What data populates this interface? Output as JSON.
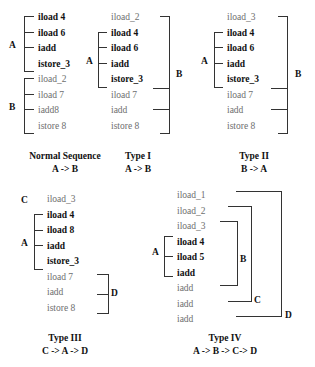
{
  "figure": {
    "colors": {
      "background": "#ffffff",
      "bold_text": "#111111",
      "normal_text": "#6e6e6e",
      "bracket_line": "#333333"
    }
  },
  "diagrams": [
    {
      "id": "normal-sequence",
      "caption_title": "Normal Sequence",
      "caption_subtitle": "A -> B",
      "groups": [
        {
          "label": "A"
        },
        {
          "label": "B"
        }
      ],
      "rows": [
        {
          "text": "iload 4",
          "bold": true
        },
        {
          "text": "iload 6",
          "bold": true
        },
        {
          "text": "iadd",
          "bold": true
        },
        {
          "text": "istore_3",
          "bold": true
        },
        {
          "text": "iload_2",
          "bold": false
        },
        {
          "text": "iload 7",
          "bold": false
        },
        {
          "text": "iadd8",
          "bold": false
        },
        {
          "text": "istore 8",
          "bold": false
        }
      ]
    },
    {
      "id": "type-i",
      "caption_title": "Type I",
      "caption_subtitle": "A -> B",
      "groups": [
        {
          "label": "A"
        },
        {
          "label": "B"
        }
      ],
      "rows": [
        {
          "text": "iload_2",
          "bold": false
        },
        {
          "text": "iload 4",
          "bold": true
        },
        {
          "text": "iload 6",
          "bold": true
        },
        {
          "text": "iadd",
          "bold": true
        },
        {
          "text": "istore_3",
          "bold": true
        },
        {
          "text": "iload 7",
          "bold": false
        },
        {
          "text": "iadd",
          "bold": false
        },
        {
          "text": "istore 8",
          "bold": false
        }
      ]
    },
    {
      "id": "type-ii",
      "caption_title": "Type II",
      "caption_subtitle": "B -> A",
      "groups": [
        {
          "label": "A"
        },
        {
          "label": "B"
        }
      ],
      "rows": [
        {
          "text": "iload_3",
          "bold": false
        },
        {
          "text": "iload 4",
          "bold": true
        },
        {
          "text": "iload 6",
          "bold": true
        },
        {
          "text": "iadd",
          "bold": true
        },
        {
          "text": "istore_3",
          "bold": true
        },
        {
          "text": "iload 7",
          "bold": false
        },
        {
          "text": "iadd",
          "bold": false
        },
        {
          "text": "istore 8",
          "bold": false
        }
      ]
    },
    {
      "id": "type-iii",
      "caption_title": "Type III",
      "caption_subtitle": "C -> A -> D",
      "groups": [
        {
          "label": "C"
        },
        {
          "label": "A"
        },
        {
          "label": "D"
        }
      ],
      "rows": [
        {
          "text": "iload_3",
          "bold": false
        },
        {
          "text": "iload 4",
          "bold": true
        },
        {
          "text": "iload 8",
          "bold": true
        },
        {
          "text": "iadd",
          "bold": true
        },
        {
          "text": "istore_3",
          "bold": true
        },
        {
          "text": "iload 7",
          "bold": false
        },
        {
          "text": "iadd",
          "bold": false
        },
        {
          "text": "istore 8",
          "bold": false
        }
      ]
    },
    {
      "id": "type-iv",
      "caption_title": "Type IV",
      "caption_subtitle": "A -> B -> C-> D",
      "groups": [
        {
          "label": "A"
        },
        {
          "label": "B"
        },
        {
          "label": "C"
        },
        {
          "label": "D"
        }
      ],
      "rows": [
        {
          "text": "iload_1",
          "bold": false
        },
        {
          "text": "iload_2",
          "bold": false
        },
        {
          "text": "iload_3",
          "bold": false
        },
        {
          "text": "iload 4",
          "bold": true
        },
        {
          "text": "iload 5",
          "bold": true
        },
        {
          "text": "iadd",
          "bold": true
        },
        {
          "text": "iadd",
          "bold": false
        },
        {
          "text": "iadd",
          "bold": false
        },
        {
          "text": "iadd",
          "bold": false
        }
      ]
    }
  ]
}
